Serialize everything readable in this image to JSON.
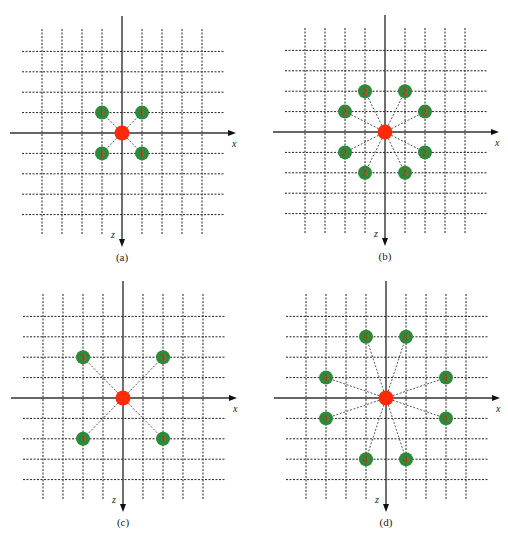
{
  "figure": {
    "axes": {
      "x_label": "x",
      "z_label": "z"
    },
    "grid": {
      "range_min": -4,
      "range_max": 4
    },
    "colors": {
      "center_node": "#ff2a0a",
      "neighbor_node": "#2e8a3a",
      "neighbor_mark": "#b0451f",
      "grid": "#222222"
    },
    "panels": [
      {
        "id": "a",
        "caption": "(a)",
        "neighbor_label": "1",
        "neighbors": [
          [
            -1,
            -1
          ],
          [
            1,
            -1
          ],
          [
            -1,
            1
          ],
          [
            1,
            1
          ]
        ]
      },
      {
        "id": "b",
        "caption": "(b)",
        "neighbor_label": "2",
        "neighbors": [
          [
            -1,
            -2
          ],
          [
            1,
            -2
          ],
          [
            -2,
            -1
          ],
          [
            2,
            -1
          ],
          [
            -2,
            1
          ],
          [
            2,
            1
          ],
          [
            -1,
            2
          ],
          [
            1,
            2
          ]
        ]
      },
      {
        "id": "c",
        "caption": "(c)",
        "neighbor_label": "3",
        "neighbors": [
          [
            -2,
            -2
          ],
          [
            2,
            -2
          ],
          [
            -2,
            2
          ],
          [
            2,
            2
          ]
        ]
      },
      {
        "id": "d",
        "caption": "(d)",
        "neighbor_label": "4",
        "neighbors": [
          [
            -1,
            -3
          ],
          [
            1,
            -3
          ],
          [
            -3,
            -1
          ],
          [
            3,
            -1
          ],
          [
            -3,
            1
          ],
          [
            3,
            1
          ],
          [
            -1,
            3
          ],
          [
            1,
            3
          ]
        ]
      }
    ]
  }
}
